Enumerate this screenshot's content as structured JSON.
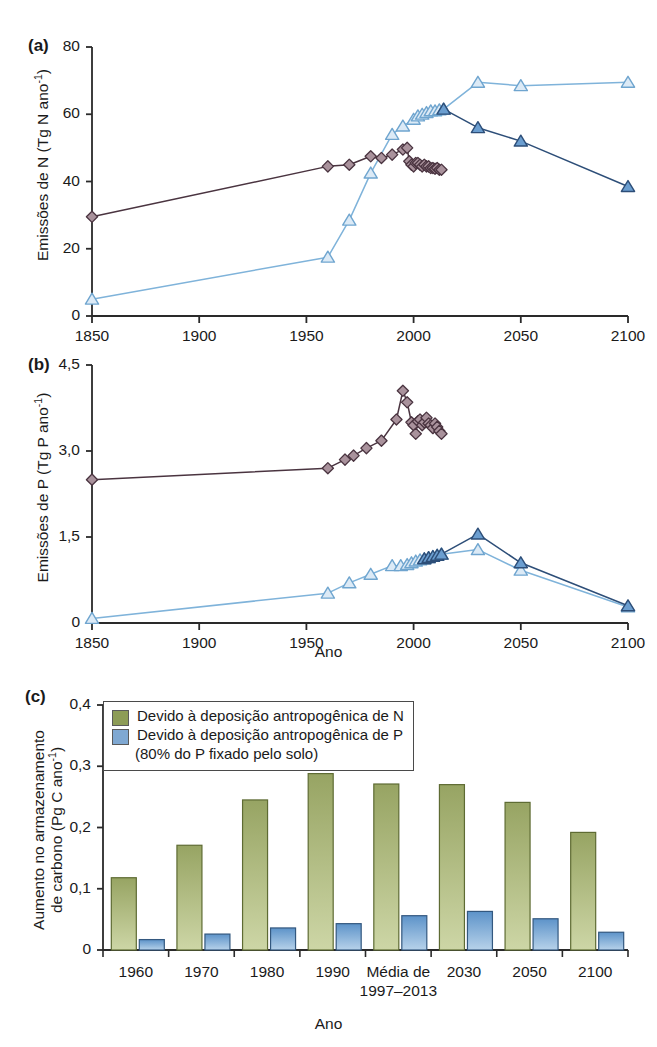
{
  "figure": {
    "xlabel_mid": "Ano",
    "xlabel_bottom": "Ano"
  },
  "panel_a": {
    "tag": "(a)",
    "ylabel_main": "Emissões de N (Tg N ano",
    "ylabel_exp": "-1",
    "ylabel_close": ")",
    "xticks": [
      "1850",
      "1900",
      "1950",
      "2000",
      "2050",
      "2100"
    ],
    "yticks": [
      "0",
      "20",
      "40",
      "60",
      "80"
    ]
  },
  "panel_b": {
    "tag": "(b)",
    "ylabel_main": "Emissões de P (Tg P ano",
    "ylabel_exp": "-1",
    "ylabel_close": ")",
    "xticks": [
      "1850",
      "1900",
      "1950",
      "2000",
      "2050",
      "2100"
    ],
    "yticks": [
      "0",
      "1,5",
      "3,0",
      "4,5"
    ]
  },
  "panel_c": {
    "tag": "(c)",
    "ylabel_l1": "Aumento no armazenamento",
    "ylabel_l2_main": "de carbono (Pg C ano",
    "ylabel_l2_exp": "-1",
    "ylabel_l2_close": ")",
    "yticks": [
      "0",
      "0,1",
      "0,2",
      "0,3",
      "0,4"
    ],
    "legend": {
      "items": [
        {
          "label": "Devido à deposição antropogênica de N",
          "color": "#8d9c56"
        },
        {
          "label": "Devido à deposição antropogênica de P",
          "color": "#7fa8d2"
        }
      ],
      "sub_note": "(80% do P fixado pelo solo)"
    }
  },
  "colors": {
    "diamond_fill": "#a9929c",
    "diamond_edge": "#4a3440",
    "diamond_line": "#4a3440",
    "tri_open_fill": "#dceaf6",
    "tri_open_edge": "#6fa5cf",
    "tri_open_line": "#7fb3da",
    "tri_fill_fill": "#6b9ed0",
    "tri_fill_edge": "#2d4e78",
    "tri_fill_line": "#2d4e78",
    "bar_green_top": "#97a463",
    "bar_green_bottom": "#cdd6a6",
    "bar_green_edge": "#5e6b33",
    "bar_blue_top": "#5d93c9",
    "bar_blue_bottom": "#b7d2ea",
    "bar_blue_edge": "#33587f",
    "axis": "#2a2a2a"
  },
  "chart_data": [
    {
      "type": "line",
      "panel": "a",
      "title": "",
      "xlabel": "Ano",
      "ylabel": "Emissões de N (Tg N ano-1)",
      "xlim": [
        1850,
        2100
      ],
      "ylim": [
        0,
        80
      ],
      "grid": false,
      "series": [
        {
          "name": "N emissions - diamonds (historical/industrial)",
          "marker": "diamond",
          "style": "filled-mauve",
          "x": [
            1850,
            1960,
            1970,
            1980,
            1985,
            1990,
            1995,
            1997,
            1998,
            1999,
            2000,
            2001,
            2002,
            2003,
            2004,
            2005,
            2006,
            2007,
            2008,
            2009,
            2010,
            2011,
            2012,
            2013
          ],
          "y": [
            29.5,
            44.5,
            45.0,
            47.5,
            47.0,
            48.0,
            49.5,
            50.0,
            46.0,
            45.0,
            44.5,
            45.5,
            45.5,
            45.0,
            44.5,
            45.0,
            44.5,
            44.5,
            44.0,
            44.0,
            43.8,
            44.0,
            43.5,
            43.5
          ]
        },
        {
          "name": "N deposition - open triangles (scenario A)",
          "marker": "triangle-open",
          "style": "open-light-blue",
          "x": [
            1850,
            1960,
            1970,
            1980,
            1990,
            1995,
            2000,
            2002,
            2004,
            2006,
            2008,
            2010,
            2012,
            2014,
            2030,
            2050,
            2100
          ],
          "y": [
            5.0,
            17.5,
            28.5,
            42.5,
            54.0,
            56.5,
            58.5,
            59.5,
            60.0,
            60.5,
            61.0,
            61.0,
            61.3,
            61.5,
            69.5,
            68.5,
            69.5
          ]
        },
        {
          "name": "N deposition - filled triangles (scenario B)",
          "marker": "triangle-filled",
          "style": "filled-dark-blue",
          "x": [
            2014,
            2030,
            2050,
            2100
          ],
          "y": [
            61.5,
            56.0,
            52.0,
            38.5
          ]
        }
      ]
    },
    {
      "type": "line",
      "panel": "b",
      "title": "",
      "xlabel": "Ano",
      "ylabel": "Emissões de P (Tg P ano-1)",
      "xlim": [
        1850,
        2100
      ],
      "ylim": [
        0,
        4.5
      ],
      "grid": false,
      "series": [
        {
          "name": "P emissions - diamonds",
          "marker": "diamond",
          "style": "filled-mauve",
          "x": [
            1850,
            1960,
            1968,
            1972,
            1978,
            1985,
            1992,
            1995,
            1997,
            1999,
            2000,
            2001,
            2002,
            2003,
            2004,
            2005,
            2006,
            2007,
            2008,
            2009,
            2010,
            2011,
            2012,
            2013
          ],
          "y": [
            2.5,
            2.7,
            2.85,
            2.92,
            3.05,
            3.18,
            3.55,
            4.05,
            3.85,
            3.5,
            3.45,
            3.3,
            3.52,
            3.55,
            3.45,
            3.5,
            3.58,
            3.48,
            3.45,
            3.4,
            3.48,
            3.42,
            3.35,
            3.3
          ]
        },
        {
          "name": "P deposition - open triangles (scenario A)",
          "marker": "triangle-open",
          "style": "open-light-blue",
          "x": [
            1850,
            1960,
            1970,
            1980,
            1990,
            1994,
            1997,
            1999,
            2001,
            2003,
            2005,
            2007,
            2009,
            2011,
            2013,
            2030,
            2050,
            2100
          ],
          "y": [
            0.08,
            0.52,
            0.7,
            0.85,
            1.0,
            1.0,
            1.02,
            1.05,
            1.08,
            1.1,
            1.12,
            1.14,
            1.16,
            1.18,
            1.2,
            1.28,
            0.92,
            0.28
          ]
        },
        {
          "name": "P deposition - filled triangles (scenario B)",
          "marker": "triangle-filled",
          "style": "filled-dark-blue",
          "x": [
            2005,
            2007,
            2009,
            2011,
            2013,
            2030,
            2050,
            2100
          ],
          "y": [
            1.12,
            1.14,
            1.16,
            1.18,
            1.2,
            1.55,
            1.05,
            0.3
          ]
        }
      ]
    },
    {
      "type": "bar",
      "panel": "c",
      "title": "",
      "xlabel": "Ano",
      "ylabel": "Aumento no armazenamento de carbono (Pg C ano-1)",
      "categories": [
        "1960",
        "1970",
        "1980",
        "1990",
        "Média de 1997-2013",
        "2030",
        "2050",
        "2100"
      ],
      "ylim": [
        0,
        0.4
      ],
      "grid": false,
      "series": [
        {
          "name": "Devido à deposição antropogênica de N",
          "color": "#97a463",
          "values": [
            0.118,
            0.171,
            0.245,
            0.288,
            0.271,
            0.27,
            0.241,
            0.192
          ]
        },
        {
          "name": "Devido à deposição antropogênica de P (80% do P fixado pelo solo)",
          "color": "#5d93c9",
          "values": [
            0.017,
            0.026,
            0.036,
            0.043,
            0.056,
            0.063,
            0.051,
            0.029
          ]
        }
      ]
    }
  ]
}
